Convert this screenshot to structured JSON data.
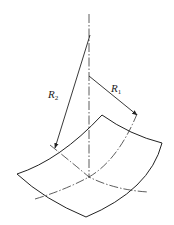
{
  "diagram": {
    "type": "saddle-surface-principal-radii",
    "labels": {
      "r2": {
        "main": "R",
        "sub": "2"
      },
      "r1": {
        "main": "R",
        "sub": "1"
      }
    },
    "colors": {
      "stroke": "#222222",
      "background": "#ffffff"
    }
  }
}
